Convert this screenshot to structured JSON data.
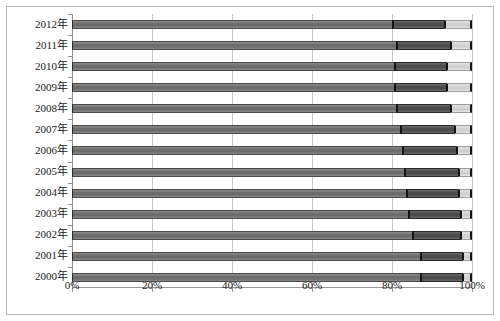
{
  "chart_data": {
    "type": "bar",
    "orientation": "horizontal",
    "stacked": true,
    "normalized": "100%",
    "title": "",
    "subtitle": "",
    "xlabel": "",
    "ylabel": "",
    "xlim": [
      0,
      100
    ],
    "xticks": [
      0,
      20,
      40,
      60,
      80,
      100
    ],
    "xticklabels": [
      "0%",
      "20%",
      "40%",
      "60%",
      "80%",
      "100%"
    ],
    "grid": true,
    "grid_axis": "x",
    "legend": "none",
    "categories": [
      "2012年",
      "2011年",
      "2010年",
      "2009年",
      "2008年",
      "2007年",
      "2006年",
      "2005年",
      "2004年",
      "2003年",
      "2002年",
      "2001年",
      "2000年"
    ],
    "series": [
      {
        "name": "series-1",
        "color": "#6f6f6f",
        "values": [
          80.0,
          81.0,
          80.5,
          80.5,
          81.0,
          82.0,
          82.5,
          83.0,
          83.5,
          84.0,
          85.0,
          87.0,
          87.0
        ]
      },
      {
        "name": "series-2",
        "color": "#4d4d4d",
        "values": [
          13.0,
          13.5,
          13.0,
          13.0,
          13.5,
          13.5,
          13.5,
          13.5,
          13.0,
          13.0,
          12.0,
          10.5,
          10.5
        ]
      },
      {
        "name": "series-3",
        "color": "#d2d2d2",
        "values": [
          7.0,
          5.5,
          6.5,
          6.5,
          5.5,
          4.5,
          4.0,
          3.5,
          3.5,
          3.0,
          3.0,
          2.5,
          2.5
        ]
      }
    ]
  }
}
